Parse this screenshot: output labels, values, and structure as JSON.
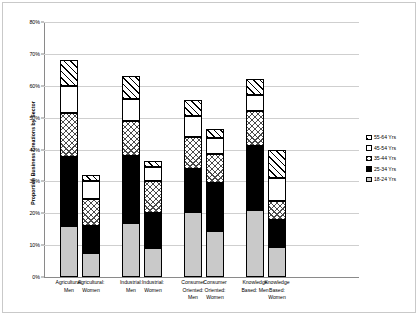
{
  "chart_data": {
    "type": "bar",
    "subtype": "stacked-bar",
    "title": "",
    "xlabel": "",
    "ylabel": "Proportion Business Creations by Sector",
    "ylim": [
      0,
      80
    ],
    "ytick_labels": [
      "0%",
      "10%",
      "20%",
      "30%",
      "40%",
      "50%",
      "60%",
      "70%",
      "80%"
    ],
    "ytick_values": [
      0,
      10,
      20,
      30,
      40,
      50,
      60,
      70,
      80
    ],
    "yunit": "%",
    "grid": true,
    "legend_position": "right",
    "categories": [
      "Agricultural: Men",
      "Agricultural: Women",
      "Industrial: Men",
      "Industrial: Women",
      "Consumer Oriented: Men",
      "Consumer Oriented: Women",
      "Knowledge Based: Men",
      "Knowledge Based: Women"
    ],
    "category_lines": [
      [
        "Agricultural:",
        "Men"
      ],
      [
        "Agricultural:",
        "Women"
      ],
      [
        "Industrial:",
        "Men"
      ],
      [
        "Industrial:",
        "Women"
      ],
      [
        "Consumer",
        "Oriented:",
        "Men"
      ],
      [
        "Consumer",
        "Oriented:",
        "Women"
      ],
      [
        "Knowledge",
        "Based: Men"
      ],
      [
        "Knowledge",
        "Based:",
        "Women"
      ]
    ],
    "series": [
      {
        "name": "18-24 Yrs",
        "pattern": "solid-gray",
        "values": [
          16.0,
          7.5,
          17.0,
          9.0,
          20.5,
          14.5,
          21.0,
          9.5
        ]
      },
      {
        "name": "25-34 Yrs",
        "pattern": "solid-black",
        "values": [
          21.5,
          8.5,
          21.0,
          11.0,
          13.5,
          15.0,
          20.0,
          8.5
        ]
      },
      {
        "name": "35-44 Yrs",
        "pattern": "checkerboard",
        "values": [
          14.0,
          8.5,
          11.0,
          10.0,
          10.0,
          9.0,
          11.0,
          6.0
        ]
      },
      {
        "name": "45-54 Yrs",
        "pattern": "white",
        "values": [
          8.5,
          5.5,
          7.0,
          4.5,
          6.5,
          5.0,
          5.0,
          7.0
        ]
      },
      {
        "name": "55-64 Yrs",
        "pattern": "diagonal-hatch",
        "values": [
          8.0,
          2.0,
          7.0,
          2.0,
          5.0,
          3.0,
          5.0,
          9.0
        ]
      }
    ],
    "totals": [
      68.0,
      32.0,
      63.0,
      36.5,
      55.5,
      46.5,
      62.0,
      40.0
    ],
    "group_gaps_after": [
      1,
      3,
      5
    ]
  },
  "legend": {
    "items": [
      {
        "label": "55-64 Yrs",
        "pattern": "diagonal-hatch"
      },
      {
        "label": "45-54 Yrs",
        "pattern": "white"
      },
      {
        "label": "35-44 Yrs",
        "pattern": "checkerboard"
      },
      {
        "label": "25-34 Yrs",
        "pattern": "solid-black"
      },
      {
        "label": "18-24 Yrs",
        "pattern": "solid-gray"
      }
    ]
  },
  "colors": {
    "band_18_24": "#c9c9c9",
    "band_25_34": "#000000",
    "band_35_44": "#ffffff",
    "band_45_54": "#ffffff",
    "band_55_64": "#ffffff",
    "outline": "#000000",
    "gridline": "#cfcfcf",
    "axis": "#8a8a8a",
    "frame": "#c9c9c9",
    "background": "#ffffff"
  }
}
